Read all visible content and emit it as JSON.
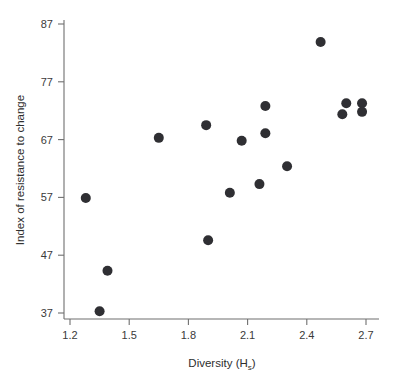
{
  "chart_data": {
    "type": "scatter",
    "title": "",
    "xlabel": "Diversity (H",
    "xlabel_sub": "s",
    "xlabel_tail": ")",
    "xlabel_full": "Diversity (Hs)",
    "ylabel": "Index of resistance to change",
    "xlim": [
      1.13,
      2.77
    ],
    "ylim": [
      35.5,
      88.5
    ],
    "grid": false,
    "legend": null,
    "xticks": [
      "1.2",
      "1.5",
      "1.8",
      "2.1",
      "2.4",
      "2.7"
    ],
    "xtick_values": [
      1.2,
      1.5,
      1.8,
      2.1,
      2.4,
      2.7
    ],
    "yticks": [
      "37",
      "47",
      "57",
      "67",
      "77",
      "87"
    ],
    "ytick_values": [
      37,
      47,
      57,
      67,
      77,
      87
    ],
    "marker": "filled-circle",
    "marker_color": "#2f2f33",
    "marker_size": 5,
    "points": [
      {
        "x": 1.28,
        "y": 56.9
      },
      {
        "x": 1.35,
        "y": 37.3
      },
      {
        "x": 1.39,
        "y": 44.3
      },
      {
        "x": 1.65,
        "y": 67.3
      },
      {
        "x": 1.89,
        "y": 69.5
      },
      {
        "x": 1.9,
        "y": 49.6
      },
      {
        "x": 2.01,
        "y": 57.8
      },
      {
        "x": 2.07,
        "y": 66.8
      },
      {
        "x": 2.16,
        "y": 59.3
      },
      {
        "x": 2.19,
        "y": 72.8
      },
      {
        "x": 2.19,
        "y": 68.1
      },
      {
        "x": 2.3,
        "y": 62.4
      },
      {
        "x": 2.47,
        "y": 83.9
      },
      {
        "x": 2.58,
        "y": 71.4
      },
      {
        "x": 2.6,
        "y": 73.3
      },
      {
        "x": 2.68,
        "y": 73.3
      },
      {
        "x": 2.68,
        "y": 71.8
      }
    ]
  },
  "colors": {
    "background": "#ffffff",
    "axis": "#6f6f6f",
    "text": "#2e2e2e",
    "marker": "#2f2f33"
  }
}
